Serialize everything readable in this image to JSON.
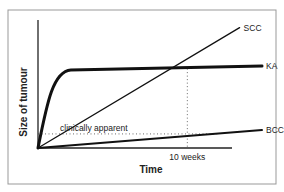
{
  "chart_data": {
    "type": "line",
    "title": "",
    "xlabel": "Time",
    "ylabel": "Size of tumour",
    "xlim": [
      0,
      15
    ],
    "ylim": [
      0,
      10
    ],
    "x_tick_label": "10 weeks",
    "x_tick_value": 10,
    "threshold": {
      "label": "clinically apparent",
      "value": 1.1
    },
    "series": [
      {
        "name": "SCC",
        "shape": "linear",
        "x": [
          0,
          13.5
        ],
        "y": [
          0,
          9.4
        ]
      },
      {
        "name": "KA",
        "shape": "rapid rise then plateau",
        "x": [
          0,
          1,
          1.5,
          2,
          3,
          15
        ],
        "y": [
          0,
          4.5,
          5.8,
          6.1,
          6.2,
          6.4
        ]
      },
      {
        "name": "BCC",
        "shape": "linear slow",
        "x": [
          0,
          15
        ],
        "y": [
          0,
          1.4
        ]
      }
    ],
    "grid": false,
    "legend": "inline labels at line ends"
  }
}
